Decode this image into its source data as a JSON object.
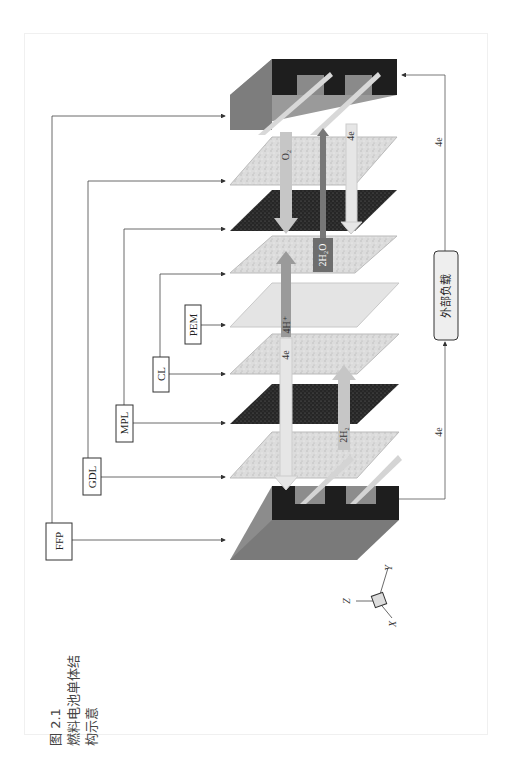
{
  "caption": {
    "number": "图 2.1",
    "line1": "燃料电池单体结",
    "line2": "构示意"
  },
  "components": {
    "ffp": "FFP",
    "gdl": "GDL",
    "mpl": "MPL",
    "cl": "CL",
    "pem": "PEM"
  },
  "external_load": "外部负载",
  "flows": {
    "o2": "O₂",
    "h2o": "2H₂O",
    "proton": "4H⁺",
    "e_cathode": "4e",
    "e_anode": "4e",
    "h2": "2H₂",
    "e_circuit_top": "4e",
    "e_circuit_bottom": "4e"
  },
  "axes": {
    "x": "X",
    "y": "Y",
    "z": "Z"
  }
}
